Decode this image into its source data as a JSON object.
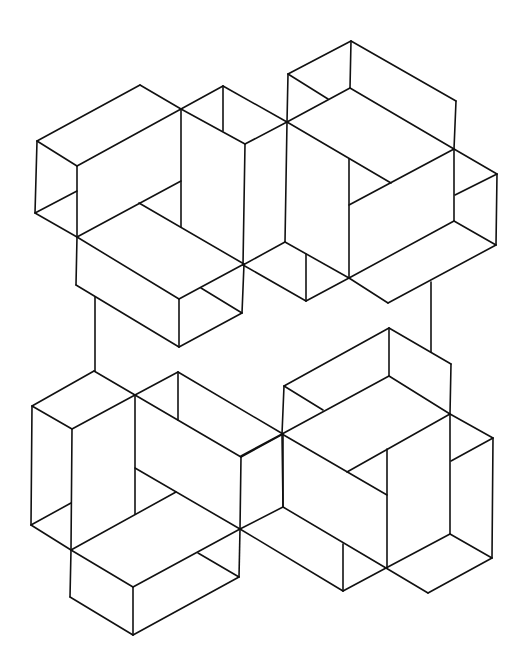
{
  "figure": {
    "type": "isometric-line-drawing",
    "stroke_color": "#111111",
    "background_color": "#ffffff",
    "groups": [
      {
        "name": "top-cluster",
        "segments": [
          [
            37,
            141,
            140,
            85
          ],
          [
            140,
            85,
            181,
            109
          ],
          [
            37,
            141,
            77,
            166
          ],
          [
            77,
            166,
            181,
            109
          ],
          [
            37,
            141,
            35,
            213
          ],
          [
            35,
            213,
            77,
            237
          ],
          [
            35,
            213,
            77,
            191
          ],
          [
            77,
            166,
            77,
            237
          ],
          [
            181,
            109,
            181,
            227
          ],
          [
            77,
            237,
            181,
            181
          ],
          [
            139,
            203,
            244,
            264
          ],
          [
            77,
            237,
            76,
            285
          ],
          [
            77,
            237,
            179,
            299
          ],
          [
            179,
            299,
            244,
            264
          ],
          [
            76,
            285,
            179,
            347
          ],
          [
            179,
            299,
            179,
            347
          ],
          [
            179,
            347,
            242,
            313
          ],
          [
            201,
            288,
            242,
            313
          ],
          [
            244,
            264,
            242,
            313
          ],
          [
            95,
            297,
            95,
            371
          ],
          [
            181,
            109,
            223,
            86
          ],
          [
            223,
            86,
            287,
            122
          ],
          [
            223,
            86,
            223,
            131
          ],
          [
            181,
            109,
            245,
            144
          ],
          [
            245,
            144,
            287,
            122
          ],
          [
            245,
            144,
            243,
            265
          ],
          [
            288,
            74,
            351,
            41
          ],
          [
            351,
            41,
            456,
            101
          ],
          [
            351,
            41,
            350,
            88
          ],
          [
            288,
            74,
            328,
            99
          ],
          [
            287,
            122,
            350,
            88
          ],
          [
            350,
            88,
            454,
            149
          ],
          [
            456,
            101,
            454,
            149
          ],
          [
            288,
            74,
            287,
            122
          ],
          [
            287,
            122,
            285,
            242
          ],
          [
            287,
            122,
            391,
            183
          ],
          [
            349,
            159,
            349,
            278
          ],
          [
            349,
            205,
            454,
            149
          ],
          [
            454,
            149,
            497,
            174
          ],
          [
            455,
            195,
            497,
            174
          ],
          [
            454,
            149,
            454,
            221
          ],
          [
            497,
            174,
            496,
            245
          ],
          [
            454,
            221,
            496,
            245
          ],
          [
            349,
            278,
            454,
            221
          ],
          [
            349,
            278,
            388,
            303
          ],
          [
            388,
            303,
            496,
            245
          ],
          [
            243,
            265,
            285,
            242
          ],
          [
            243,
            265,
            306,
            301
          ],
          [
            306,
            254,
            306,
            301
          ],
          [
            306,
            301,
            349,
            278
          ],
          [
            285,
            242,
            349,
            278
          ],
          [
            431,
            282,
            431,
            352
          ]
        ]
      },
      {
        "name": "bottom-cluster",
        "segments": [
          [
            32,
            406,
            94,
            371
          ],
          [
            94,
            371,
            135,
            395
          ],
          [
            32,
            406,
            72,
            429
          ],
          [
            72,
            429,
            135,
            395
          ],
          [
            135,
            395,
            178,
            372
          ],
          [
            178,
            372,
            283,
            434
          ],
          [
            178,
            372,
            178,
            420
          ],
          [
            135,
            395,
            241,
            457
          ],
          [
            241,
            457,
            283,
            434
          ],
          [
            32,
            406,
            31,
            525
          ],
          [
            31,
            525,
            71,
            503
          ],
          [
            72,
            429,
            71,
            550
          ],
          [
            31,
            525,
            71,
            550
          ],
          [
            135,
            395,
            135,
            514
          ],
          [
            135,
            468,
            240,
            529
          ],
          [
            71,
            550,
            176,
            492
          ],
          [
            71,
            550,
            70,
            597
          ],
          [
            71,
            550,
            133,
            587
          ],
          [
            133,
            587,
            240,
            529
          ],
          [
            70,
            597,
            133,
            635
          ],
          [
            133,
            587,
            133,
            635
          ],
          [
            133,
            635,
            239,
            577
          ],
          [
            198,
            553,
            239,
            577
          ],
          [
            241,
            457,
            240,
            529
          ],
          [
            240,
            529,
            239,
            577
          ],
          [
            283,
            434,
            283,
            507
          ],
          [
            240,
            529,
            283,
            507
          ],
          [
            240,
            529,
            343,
            591
          ],
          [
            343,
            544,
            343,
            591
          ],
          [
            343,
            591,
            386,
            568
          ],
          [
            283,
            507,
            386,
            568
          ],
          [
            284,
            386,
            389,
            328
          ],
          [
            389,
            328,
            451,
            364
          ],
          [
            389,
            328,
            389,
            376
          ],
          [
            284,
            386,
            323,
            410
          ],
          [
            282,
            434,
            389,
            376
          ],
          [
            389,
            376,
            450,
            414
          ],
          [
            451,
            364,
            450,
            414
          ],
          [
            284,
            386,
            282,
            434
          ],
          [
            282,
            434,
            283,
            507
          ],
          [
            282,
            434,
            387,
            495
          ],
          [
            387,
            449,
            387,
            568
          ],
          [
            347,
            472,
            450,
            414
          ],
          [
            450,
            414,
            493,
            438
          ],
          [
            451,
            461,
            493,
            438
          ],
          [
            450,
            414,
            450,
            534
          ],
          [
            493,
            438,
            492,
            558
          ],
          [
            450,
            534,
            492,
            558
          ],
          [
            386,
            568,
            450,
            534
          ],
          [
            386,
            568,
            428,
            593
          ],
          [
            428,
            593,
            492,
            558
          ],
          [
            241,
            456,
            282,
            434
          ]
        ]
      }
    ]
  }
}
